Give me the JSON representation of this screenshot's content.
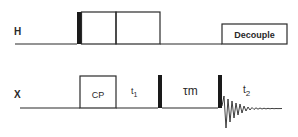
{
  "diagram": {
    "type": "pulse-sequence",
    "channels": [
      {
        "name": "H",
        "elements": [
          {
            "kind": "pulse-90",
            "label": ""
          },
          {
            "kind": "spinlock-box",
            "label": ""
          },
          {
            "kind": "spinlock-box",
            "label": ""
          },
          {
            "kind": "decouple-box",
            "label": "Decouple"
          }
        ]
      },
      {
        "name": "X",
        "elements": [
          {
            "kind": "cp-box",
            "label": "CP"
          },
          {
            "kind": "delay",
            "label": "t",
            "sub": "1"
          },
          {
            "kind": "pulse-90",
            "label": ""
          },
          {
            "kind": "delay",
            "label": "τ",
            "sub": "m"
          },
          {
            "kind": "pulse-90",
            "label": ""
          },
          {
            "kind": "acquisition-fid",
            "label": "t",
            "sub": "2"
          }
        ]
      }
    ]
  },
  "labels": {
    "channel_h": "H",
    "channel_x": "X",
    "decouple": "Decouple",
    "cp": "CP",
    "t1_main": "t",
    "t1_sub": "1",
    "tau_main": "τ",
    "tau_sub": "m",
    "t2_main": "t",
    "t2_sub": "2"
  },
  "colors": {
    "line": "#2a2a2a",
    "pulse": "#1a1a1a",
    "background": "#ffffff"
  }
}
